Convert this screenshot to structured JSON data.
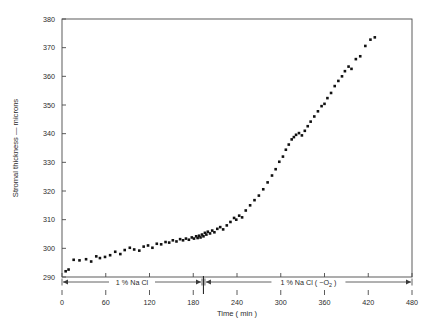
{
  "chart_data": {
    "type": "scatter",
    "title": "",
    "xlabel": "Time ( min )",
    "ylabel": "Stromal thickness — microns",
    "xlim": [
      0,
      480
    ],
    "ylim": [
      290,
      380
    ],
    "xticks": [
      0,
      60,
      120,
      180,
      240,
      300,
      360,
      420,
      480
    ],
    "yticks": [
      290,
      300,
      310,
      320,
      330,
      340,
      350,
      360,
      370,
      380
    ],
    "grid": false,
    "legend": "none",
    "marker": "filled-square",
    "marker_color": "#111111",
    "series": [
      {
        "name": "Stromal thickness",
        "points": [
          [
            5,
            292.0
          ],
          [
            9,
            292.6
          ],
          [
            16,
            296.0
          ],
          [
            24,
            295.8
          ],
          [
            33,
            296.2
          ],
          [
            40,
            295.4
          ],
          [
            47,
            297.2
          ],
          [
            52,
            296.6
          ],
          [
            59,
            297.0
          ],
          [
            66,
            297.6
          ],
          [
            73,
            298.8
          ],
          [
            80,
            298.0
          ],
          [
            86,
            299.4
          ],
          [
            93,
            300.2
          ],
          [
            99,
            299.6
          ],
          [
            106,
            299.2
          ],
          [
            112,
            300.6
          ],
          [
            118,
            301.0
          ],
          [
            124,
            300.2
          ],
          [
            130,
            301.6
          ],
          [
            136,
            301.4
          ],
          [
            142,
            302.2
          ],
          [
            147,
            302.0
          ],
          [
            152,
            302.8
          ],
          [
            157,
            302.4
          ],
          [
            162,
            303.2
          ],
          [
            166,
            302.8
          ],
          [
            170,
            303.4
          ],
          [
            174,
            303.0
          ],
          [
            178,
            303.8
          ],
          [
            181,
            303.4
          ],
          [
            184,
            304.2
          ],
          [
            186,
            303.6
          ],
          [
            188,
            304.4
          ],
          [
            190,
            303.8
          ],
          [
            192,
            304.8
          ],
          [
            194,
            304.2
          ],
          [
            196,
            305.4
          ],
          [
            198,
            304.8
          ],
          [
            200,
            305.8
          ],
          [
            203,
            305.2
          ],
          [
            206,
            306.2
          ],
          [
            209,
            305.6
          ],
          [
            213,
            306.8
          ],
          [
            217,
            307.4
          ],
          [
            221,
            306.6
          ],
          [
            226,
            308.0
          ],
          [
            231,
            309.2
          ],
          [
            236,
            310.6
          ],
          [
            239,
            310.0
          ],
          [
            243,
            311.4
          ],
          [
            247,
            310.8
          ],
          [
            252,
            313.2
          ],
          [
            258,
            315.0
          ],
          [
            264,
            316.8
          ],
          [
            270,
            318.4
          ],
          [
            276,
            320.6
          ],
          [
            282,
            323.0
          ],
          [
            288,
            325.4
          ],
          [
            293,
            327.6
          ],
          [
            298,
            330.2
          ],
          [
            303,
            332.0
          ],
          [
            307,
            334.4
          ],
          [
            311,
            336.2
          ],
          [
            315,
            338.0
          ],
          [
            318,
            338.8
          ],
          [
            321,
            339.6
          ],
          [
            325,
            340.2
          ],
          [
            329,
            339.4
          ],
          [
            333,
            341.0
          ],
          [
            337,
            342.6
          ],
          [
            341,
            344.2
          ],
          [
            346,
            346.0
          ],
          [
            351,
            347.8
          ],
          [
            356,
            349.6
          ],
          [
            360,
            350.4
          ],
          [
            364,
            352.4
          ],
          [
            369,
            354.2
          ],
          [
            374,
            356.6
          ],
          [
            379,
            358.4
          ],
          [
            384,
            360.0
          ],
          [
            388,
            361.8
          ],
          [
            393,
            363.4
          ],
          [
            397,
            362.6
          ],
          [
            403,
            366.0
          ],
          [
            409,
            367.0
          ],
          [
            416,
            370.6
          ],
          [
            423,
            372.8
          ],
          [
            429,
            373.6
          ]
        ]
      }
    ],
    "annotations": [
      {
        "id": "phase-1",
        "label": "1 % Na Cl",
        "x_start": 0,
        "x_end": 192,
        "style": "double-arrow-bar"
      },
      {
        "id": "phase-2",
        "label": "1 % Na Cl ( −O",
        "label_sub": "2",
        "label_tail": " )",
        "x_start": 196,
        "x_end": 480,
        "style": "double-arrow-bar"
      }
    ],
    "divider": {
      "x": 194,
      "note": "phase separator between 1 % Na Cl and 1 % Na Cl (-O2)"
    }
  },
  "axes": {
    "y_title": "Stromal thickness — microns",
    "x_title": "Time ( min )"
  }
}
